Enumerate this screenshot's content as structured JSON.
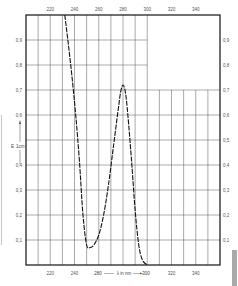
{
  "chart_data": {
    "type": "line",
    "title": "",
    "xlabel": "λ in nm",
    "ylabel": "E 1cm",
    "xlim": [
      200,
      360
    ],
    "ylim": [
      0,
      1.0
    ],
    "x_ticks_top": [
      "220",
      "240",
      "260",
      "280",
      "300",
      "320",
      "340"
    ],
    "x_ticks_bottom": [
      "220",
      "240",
      "280",
      "300",
      "320",
      "340"
    ],
    "bottom_axis_caption": "280 —— λ in nm ——→ 300",
    "y_ticks_left": [
      "0,9",
      "0,8",
      "0,7",
      "0,6",
      "0,5",
      "0,4",
      "0,3",
      "0,2",
      "0,1"
    ],
    "y_ticks_right": [
      "0,9",
      "0,8",
      "0,7",
      "0,6",
      "0,5",
      "0,4",
      "0,3",
      "0,2",
      "0,1"
    ],
    "grid": true,
    "legend": null,
    "series": [
      {
        "name": "absorption spectrum",
        "style": "dashed",
        "x": [
          232,
          235,
          238,
          241,
          244,
          247,
          250,
          253,
          256,
          260,
          264,
          268,
          272,
          276,
          278,
          280,
          282,
          284,
          287,
          290,
          293,
          296,
          300
        ],
        "y": [
          1.0,
          0.88,
          0.75,
          0.6,
          0.42,
          0.2,
          0.08,
          0.07,
          0.08,
          0.12,
          0.2,
          0.32,
          0.47,
          0.62,
          0.69,
          0.72,
          0.69,
          0.6,
          0.42,
          0.22,
          0.08,
          0.02,
          0.0
        ]
      }
    ]
  },
  "labels": {
    "y_axis_symbol": "E",
    "y_axis_unit": "1cm",
    "x_axis_left_tick": "280",
    "x_axis_text": "λ in nm",
    "x_axis_right_tick": "300"
  }
}
